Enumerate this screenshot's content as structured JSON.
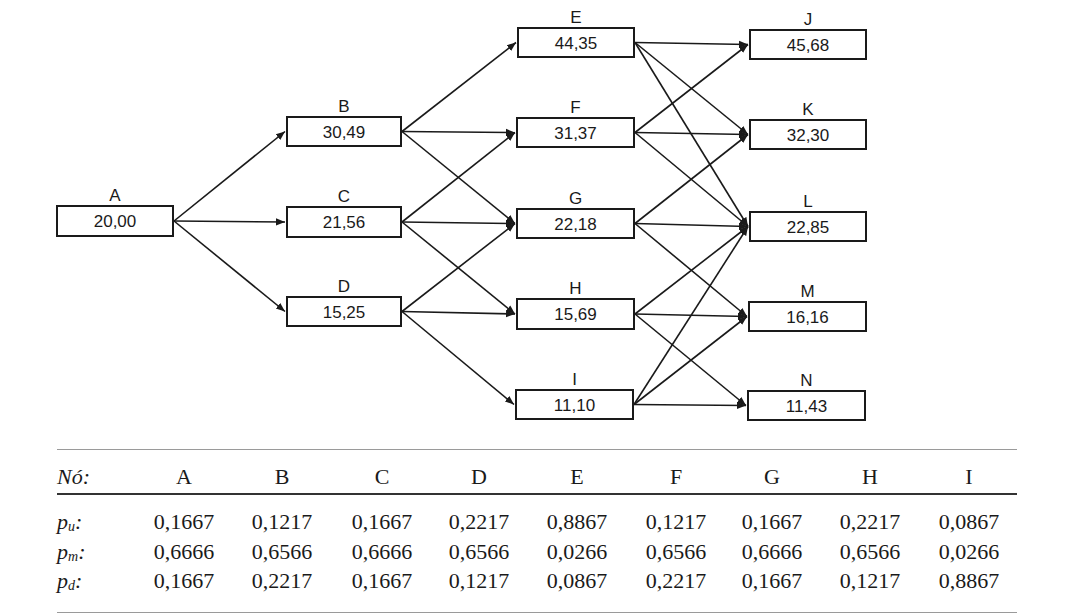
{
  "diagram": {
    "title": "",
    "nodes": [
      {
        "id": "A",
        "label": "A",
        "value": "20,00"
      },
      {
        "id": "B",
        "label": "B",
        "value": "30,49"
      },
      {
        "id": "C",
        "label": "C",
        "value": "21,56"
      },
      {
        "id": "D",
        "label": "D",
        "value": "15,25"
      },
      {
        "id": "E",
        "label": "E",
        "value": "44,35"
      },
      {
        "id": "F",
        "label": "F",
        "value": "31,37"
      },
      {
        "id": "G",
        "label": "G",
        "value": "22,18"
      },
      {
        "id": "H",
        "label": "H",
        "value": "15,69"
      },
      {
        "id": "I",
        "label": "I",
        "value": "11,10"
      },
      {
        "id": "J",
        "label": "J",
        "value": "45,68"
      },
      {
        "id": "K",
        "label": "K",
        "value": "32,30"
      },
      {
        "id": "L",
        "label": "L",
        "value": "22,85"
      },
      {
        "id": "M",
        "label": "M",
        "value": "16,16"
      },
      {
        "id": "N",
        "label": "N",
        "value": "11,43"
      }
    ],
    "edges": [
      [
        "A",
        "B"
      ],
      [
        "A",
        "C"
      ],
      [
        "A",
        "D"
      ],
      [
        "B",
        "E"
      ],
      [
        "B",
        "F"
      ],
      [
        "B",
        "G"
      ],
      [
        "C",
        "F"
      ],
      [
        "C",
        "G"
      ],
      [
        "C",
        "H"
      ],
      [
        "D",
        "G"
      ],
      [
        "D",
        "H"
      ],
      [
        "D",
        "I"
      ],
      [
        "E",
        "J"
      ],
      [
        "E",
        "K"
      ],
      [
        "E",
        "L"
      ],
      [
        "F",
        "J"
      ],
      [
        "F",
        "K"
      ],
      [
        "F",
        "L"
      ],
      [
        "G",
        "K"
      ],
      [
        "G",
        "L"
      ],
      [
        "G",
        "M"
      ],
      [
        "H",
        "L"
      ],
      [
        "H",
        "M"
      ],
      [
        "H",
        "N"
      ],
      [
        "I",
        "L"
      ],
      [
        "I",
        "M"
      ],
      [
        "I",
        "N"
      ]
    ]
  },
  "table": {
    "header_label": "Nó:",
    "columns": [
      "A",
      "B",
      "C",
      "D",
      "E",
      "F",
      "G",
      "H",
      "I"
    ],
    "rows": [
      {
        "symbol": "p",
        "subscript": "u",
        "values": [
          "0,1667",
          "0,1217",
          "0,1667",
          "0,2217",
          "0,8867",
          "0,1217",
          "0,1667",
          "0,2217",
          "0,0867"
        ]
      },
      {
        "symbol": "p",
        "subscript": "m",
        "values": [
          "0,6666",
          "0,6566",
          "0,6666",
          "0,6566",
          "0,0266",
          "0,6566",
          "0,6666",
          "0,6566",
          "0,0266"
        ]
      },
      {
        "symbol": "p",
        "subscript": "d",
        "values": [
          "0,1667",
          "0,2217",
          "0,1667",
          "0,1217",
          "0,0867",
          "0,2217",
          "0,1667",
          "0,1217",
          "0,8867"
        ]
      }
    ]
  }
}
